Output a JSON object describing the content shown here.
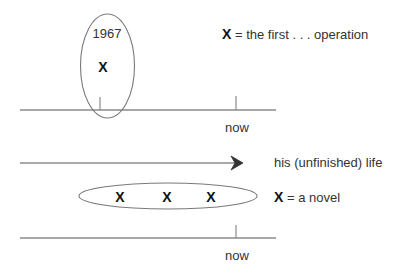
{
  "diagram": {
    "colors": {
      "line": "#8a8a8a",
      "ellipse": "#7a7a7a",
      "text": "#333333",
      "marker": "#111111"
    },
    "timeline_top": {
      "year_label": "1967",
      "marker": "X",
      "now_label": "now",
      "legend": {
        "marker": "X",
        "text": "= the first . . . operation"
      }
    },
    "arrow": {
      "label": "his (unfinished) life"
    },
    "timeline_bottom": {
      "markers": [
        "X",
        "X",
        "X"
      ],
      "now_label": "now",
      "legend": {
        "marker": "X",
        "text": "= a novel"
      }
    }
  }
}
